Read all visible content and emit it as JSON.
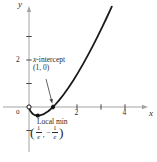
{
  "figure": {
    "colors": {
      "background": "#ffffff",
      "axis": "#a3a3a3",
      "tick": "#474747",
      "curve": "#1a1a1a",
      "point": "#111111",
      "leader": "#3a3a3a",
      "text": "#2b2b2b"
    }
  },
  "chart_data": {
    "type": "line",
    "title": "",
    "xlabel": "x",
    "ylabel": "y",
    "origin_label": "0",
    "x_ticks": [
      {
        "value": 1,
        "label": ""
      },
      {
        "value": 2,
        "label": "2"
      },
      {
        "value": 3,
        "label": ""
      },
      {
        "value": 4,
        "label": "4"
      }
    ],
    "y_ticks": [
      {
        "value": -1,
        "label": ""
      },
      {
        "value": 1,
        "label": ""
      },
      {
        "value": 2,
        "label": "2"
      },
      {
        "value": 3,
        "label": ""
      }
    ],
    "x_range": [
      -1.1,
      4.9
    ],
    "y_range": [
      -2,
      4.3
    ],
    "grid": false,
    "curve_points": [
      [
        0.02,
        -0.078
      ],
      [
        0.06,
        -0.169
      ],
      [
        0.12,
        -0.254
      ],
      [
        0.18,
        -0.309
      ],
      [
        0.25,
        -0.347
      ],
      [
        0.31,
        -0.363
      ],
      [
        0.3679,
        -0.368
      ],
      [
        0.45,
        -0.359
      ],
      [
        0.55,
        -0.329
      ],
      [
        0.65,
        -0.28
      ],
      [
        0.8,
        -0.179
      ],
      [
        0.9,
        -0.095
      ],
      [
        1,
        0
      ],
      [
        1.1,
        0.105
      ],
      [
        1.25,
        0.279
      ],
      [
        1.45,
        0.539
      ],
      [
        1.65,
        0.827
      ],
      [
        1.85,
        1.138
      ],
      [
        2.05,
        1.471
      ],
      [
        2.25,
        1.824
      ],
      [
        2.45,
        2.196
      ],
      [
        2.65,
        2.583
      ],
      [
        2.85,
        2.985
      ],
      [
        3.05,
        3.401
      ],
      [
        3.25,
        3.831
      ],
      [
        3.45,
        4.272
      ]
    ],
    "key_points": [
      {
        "x": 0,
        "y": 0,
        "style": "open",
        "name": "origin-point"
      },
      {
        "x": 0.3679,
        "y": -0.3679,
        "style": "filled",
        "name": "local-min-point"
      },
      {
        "x": 1,
        "y": 0,
        "style": "filled",
        "name": "x-intercept-point"
      }
    ],
    "annotations": {
      "x_intercept": {
        "var": "x",
        "rest": "-intercept",
        "coords": "(1, 0)",
        "has_leader_arrow": true
      },
      "local_min": {
        "title": "Local min",
        "open_paren": "(",
        "frac1_num": "1",
        "frac1_den": "e",
        "comma": ",",
        "minus": "−",
        "frac2_num": "1",
        "frac2_den": "e",
        "close_paren": ")"
      }
    }
  }
}
